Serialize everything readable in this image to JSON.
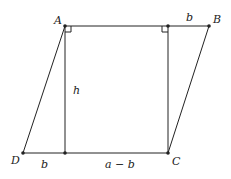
{
  "diagram": {
    "points": {
      "A": {
        "label": "A",
        "x": 65,
        "y": 26
      },
      "B": {
        "label": "B",
        "x": 209,
        "y": 26
      },
      "C": {
        "label": "C",
        "x": 168,
        "y": 153
      },
      "D": {
        "label": "D",
        "x": 23,
        "y": 153
      },
      "E": {
        "label": "",
        "x": 168,
        "y": 26
      },
      "F": {
        "label": "",
        "x": 65,
        "y": 153
      }
    },
    "segment_labels": {
      "top_right": "b",
      "height": "h",
      "bottom_left": "b",
      "bottom_middle": "a − b"
    },
    "colors": {
      "stroke": "#222222",
      "background": "#ffffff"
    }
  }
}
